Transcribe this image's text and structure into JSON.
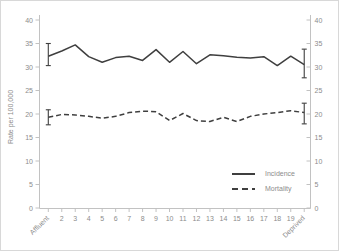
{
  "chart_data": {
    "type": "line",
    "title": "",
    "xlabel": "",
    "ylabel": "Rate per 100,000",
    "x_categories": [
      "Affluent",
      "2",
      "3",
      "4",
      "5",
      "6",
      "7",
      "8",
      "9",
      "10",
      "11",
      "12",
      "13",
      "14",
      "15",
      "16",
      "17",
      "18",
      "19",
      "Deprived"
    ],
    "ylim": [
      0,
      40
    ],
    "yticks": [
      0,
      5,
      10,
      15,
      20,
      25,
      30,
      35,
      40
    ],
    "dual_y_axis": true,
    "grid": false,
    "legend_position": "lower right",
    "series": [
      {
        "name": "Incidence",
        "line_style": "solid",
        "values": [
          32.3,
          33.4,
          34.7,
          32.2,
          31.0,
          32.0,
          32.3,
          31.4,
          33.7,
          31.0,
          33.3,
          30.7,
          32.6,
          32.4,
          32.1,
          31.9,
          32.2,
          30.3,
          32.3,
          30.5
        ],
        "error_bars": [
          {
            "index": 0,
            "low": 30.3,
            "high": 35.0
          },
          {
            "index": 19,
            "low": 27.7,
            "high": 33.8
          }
        ]
      },
      {
        "name": "Mortality",
        "line_style": "dashed",
        "values": [
          19.3,
          19.9,
          19.8,
          19.5,
          19.1,
          19.5,
          20.3,
          20.6,
          20.5,
          18.6,
          20.1,
          18.6,
          18.4,
          19.3,
          18.4,
          19.5,
          20.0,
          20.3,
          20.7,
          20.3
        ],
        "error_bars": [
          {
            "index": 0,
            "low": 17.7,
            "high": 20.9
          },
          {
            "index": 19,
            "low": 17.9,
            "high": 22.3
          }
        ]
      }
    ],
    "colors": {
      "line": "#3f3f3f",
      "axis": "#c2c2c2",
      "tick_text": "#8c8c8c"
    }
  }
}
